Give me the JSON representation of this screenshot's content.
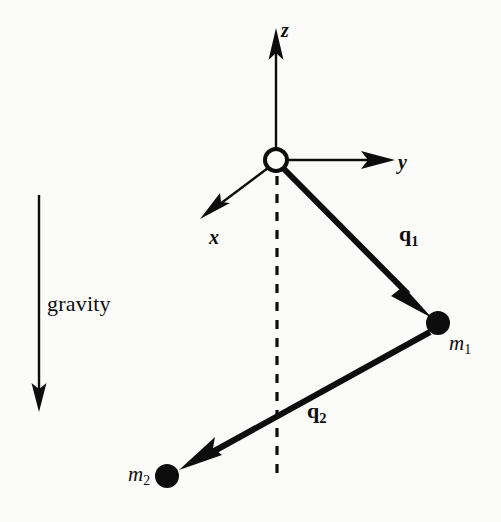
{
  "figure": {
    "name": "double-pendulum-coordinate-diagram",
    "background_color": "#fbfbf9",
    "ink_color": "#0d0d0d"
  },
  "axes": {
    "origin": {
      "label": "origin-pivot",
      "cx": 276,
      "cy": 160,
      "r": 11,
      "filled": false
    },
    "items": [
      {
        "name": "z-axis",
        "label": "z",
        "from": [
          276,
          148
        ],
        "to": [
          276,
          30
        ],
        "arrow": true,
        "style": "solid"
      },
      {
        "name": "y-axis",
        "label": "y",
        "from": [
          288,
          160
        ],
        "to": [
          393,
          160
        ],
        "arrow": true,
        "style": "solid"
      },
      {
        "name": "x-axis",
        "label": "x",
        "from": [
          268,
          169
        ],
        "to": [
          201,
          220
        ],
        "arrow": true,
        "style": "solid"
      }
    ],
    "vertical_reference": {
      "name": "vertical-dashed-reference",
      "label": "",
      "from": [
        277,
        175
      ],
      "to": [
        277,
        476
      ],
      "style": "dashed",
      "dash": [
        9,
        9
      ]
    }
  },
  "vectors": [
    {
      "name": "q1-vector",
      "label": "q",
      "subscript": "1",
      "from": [
        284,
        170
      ],
      "to": [
        430,
        317
      ],
      "arrow": true,
      "width": 6
    },
    {
      "name": "q2-vector",
      "label": "q",
      "subscript": "2",
      "from": [
        430,
        331
      ],
      "to": [
        178,
        470
      ],
      "arrow": true,
      "width": 6
    }
  ],
  "masses": [
    {
      "name": "mass-m1",
      "label": "m",
      "subscript": "1",
      "cx": 438,
      "cy": 323,
      "r": 11,
      "filled": true
    },
    {
      "name": "mass-m2",
      "label": "m",
      "subscript": "2",
      "cx": 167,
      "cy": 476,
      "r": 11,
      "filled": true
    }
  ],
  "gravity": {
    "name": "gravity-indicator",
    "label": "gravity",
    "arrow_from": [
      39,
      195
    ],
    "arrow_to": [
      39,
      410
    ],
    "arrow": true,
    "width": 2
  }
}
